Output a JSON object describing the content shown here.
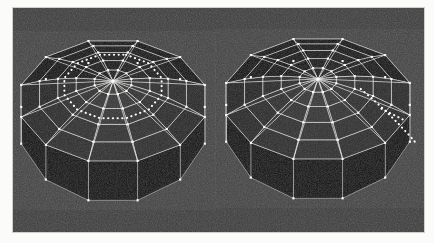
{
  "scene": {
    "title": "Two geodesic dome models",
    "medium": "photograph",
    "background_color": "#3b3b3b",
    "frame_color": "#fbfbf9",
    "line_color": "#e8e8e6",
    "vertex_color": "#ffffff",
    "photo": {
      "x": 13,
      "y": 8,
      "width": 411,
      "height": 224
    }
  },
  "objects": [
    {
      "id": "dome-left",
      "label": "left-dome",
      "sides": 12,
      "rings": 5,
      "center": {
        "x": 113,
        "y": 81
      },
      "radius_x": 95,
      "radius_y": 62,
      "skirt_height": 40,
      "annotation": {
        "type": "closed-dotted-loop",
        "name": "dotted-ring-path",
        "ring_index": 3,
        "color": "#ffffff"
      },
      "face_shades": [
        "#1b1b1b",
        "#0a0a0a",
        "#111111",
        "#232323",
        "#2e2e2e",
        "#383838",
        "#333333",
        "#272727",
        "#1a1a1a",
        "#0e0e0e",
        "#141414",
        "#202020"
      ]
    },
    {
      "id": "dome-right",
      "label": "right-dome",
      "sides": 12,
      "rings": 5,
      "center": {
        "x": 318,
        "y": 79
      },
      "radius_x": 95,
      "radius_y": 62,
      "skirt_height": 40,
      "annotation": {
        "type": "radial-dotted-line",
        "name": "dotted-radial-path",
        "spoke_index": 3,
        "color": "#ffffff"
      },
      "face_shades": [
        "#1b1b1b",
        "#0a0a0a",
        "#111111",
        "#232323",
        "#2e2e2e",
        "#383838",
        "#333333",
        "#272727",
        "#1a1a1a",
        "#0e0e0e",
        "#141414",
        "#202020"
      ]
    }
  ]
}
